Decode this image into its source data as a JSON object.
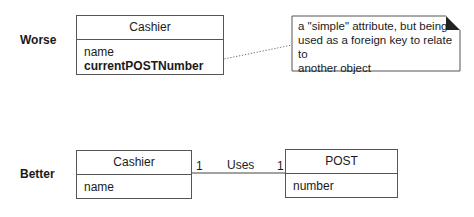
{
  "worse": {
    "row_label": "Worse",
    "class": {
      "name": "Cashier",
      "attributes": [
        {
          "text": "name",
          "bold": false
        },
        {
          "text": "currentPOSTNumber",
          "bold": true
        }
      ]
    },
    "note": {
      "text": "a \"simple\" attribute, but being used as a foreign key to relate to another object",
      "lines": [
        "a \"simple\" attribute, but being",
        "used as a foreign key to relate to",
        "another object"
      ]
    }
  },
  "better": {
    "row_label": "Better",
    "class_left": {
      "name": "Cashier",
      "attributes": [
        "name"
      ]
    },
    "class_right": {
      "name": "POST",
      "attributes": [
        "number"
      ]
    },
    "association": {
      "name": "Uses",
      "left_multiplicity": "1",
      "right_multiplicity": "1"
    }
  },
  "colors": {
    "line": "#555555",
    "note_fold": "#222222"
  }
}
